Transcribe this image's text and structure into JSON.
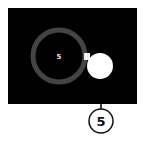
{
  "diagram": {
    "panel": {
      "background": "#000000"
    },
    "ring": {
      "label": "5",
      "stroke_color": "#444444",
      "label_color": "#e8e8e8"
    },
    "knob": {
      "fill": "#ffffff"
    },
    "callout": {
      "label": "5",
      "line_color": "#000000",
      "border_color": "#111111"
    }
  }
}
